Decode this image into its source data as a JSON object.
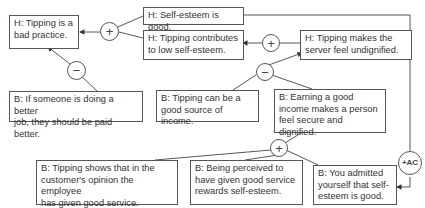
{
  "diagram": {
    "type": "argument-map",
    "nodes": [
      {
        "id": "h1",
        "text": "H: Tipping is a\nbad practice."
      },
      {
        "id": "h2",
        "text": "H: Self-esteem is good."
      },
      {
        "id": "h3",
        "text": "H: Tipping contributes\nto low self-esteem."
      },
      {
        "id": "h4",
        "text": "H: Tipping makes the\nserver feel undignified."
      },
      {
        "id": "b1",
        "text": "B: If someone is doing a better\njob, they should be paid better."
      },
      {
        "id": "b2",
        "text": "B: Tipping can be a\ngood source of income."
      },
      {
        "id": "b3",
        "text": "B: Earning a good\nincome makes a person\nfeel secure and dignified."
      },
      {
        "id": "b4",
        "text": "B: Tipping shows that in the\ncustomer's opinion the employee\nhas given good service."
      },
      {
        "id": "b5",
        "text": "B: Being perceived to\nhave given good service\nrewards self-esteem."
      },
      {
        "id": "b6",
        "text": "B: You admitted\nyourself that self-\nesteem is good."
      }
    ],
    "operators": [
      {
        "id": "op1",
        "symbol": "+",
        "from": [
          "h2",
          "h3"
        ],
        "to": "h1"
      },
      {
        "id": "op2",
        "symbol": "−",
        "from": [
          "b1"
        ],
        "to": "h1"
      },
      {
        "id": "op3",
        "symbol": "+",
        "from": [
          "h4"
        ],
        "to": "h3"
      },
      {
        "id": "op4",
        "symbol": "−",
        "from": [
          "b2",
          "b3"
        ],
        "to": "h4"
      },
      {
        "id": "op5",
        "symbol": "+",
        "from": [
          "b4",
          "b5",
          "b6"
        ],
        "to": "b3"
      },
      {
        "id": "op6",
        "symbol": "+AC",
        "from": [
          "h2"
        ],
        "to": "b6"
      }
    ]
  }
}
